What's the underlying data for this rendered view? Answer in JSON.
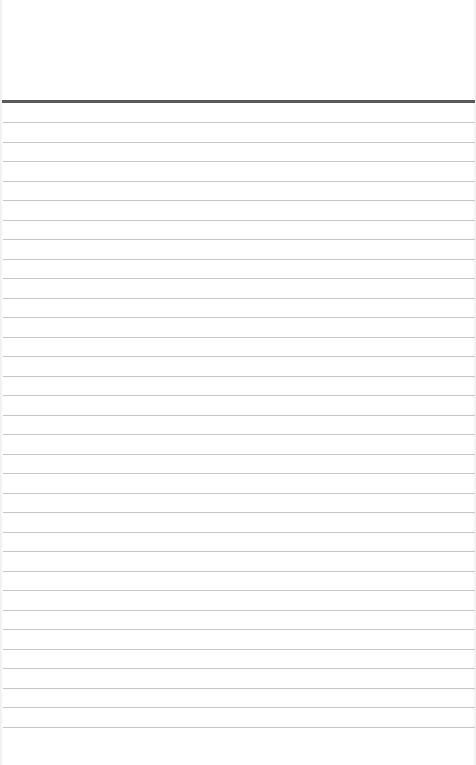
{
  "notepad": {
    "header_text": "",
    "lines": [
      "",
      "",
      "",
      "",
      "",
      "",
      "",
      "",
      "",
      "",
      "",
      "",
      "",
      "",
      "",
      "",
      "",
      "",
      "",
      "",
      "",
      "",
      "",
      "",
      "",
      "",
      "",
      "",
      "",
      "",
      "",
      ""
    ],
    "colors": {
      "paper": "#ffffff",
      "header_rule": "#5a5a5a",
      "line_rule": "#c6c6c6"
    }
  }
}
